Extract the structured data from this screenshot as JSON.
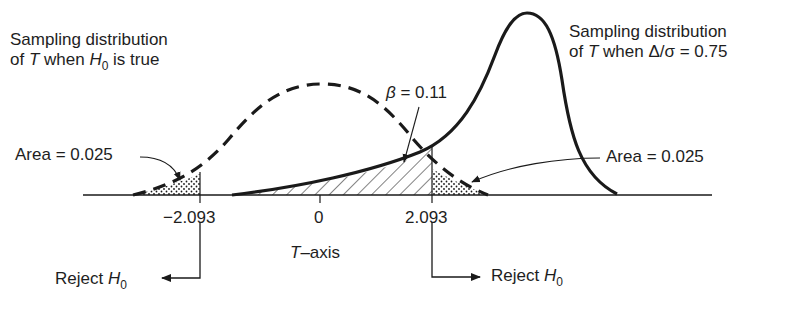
{
  "labels": {
    "null_dist_line1": "Sampling distribution",
    "null_dist_line2_pre": "of ",
    "null_dist_T": "T",
    "null_dist_line2_mid": " when ",
    "null_dist_H": "H",
    "null_dist_sub": "0",
    "null_dist_line2_post": " is true",
    "alt_dist_line1": "Sampling distribution",
    "alt_dist_line2_pre": "of ",
    "alt_dist_T": "T",
    "alt_dist_line2_post": " when Δ/σ = 0.75",
    "beta_symbol": "β",
    "beta_value": " = 0.11",
    "area_left": "Area = 0.025",
    "area_right": "Area = 0.025",
    "tick_left": "−2.093",
    "tick_zero": "0",
    "tick_right": "2.093",
    "axis_T": "T",
    "axis_suffix": "–axis",
    "reject_left": "Reject ",
    "reject_right": "Reject ",
    "reject_H": "H",
    "reject_sub": "0"
  },
  "colors": {
    "ink": "#1a1a1a",
    "background": "#ffffff"
  },
  "diagram": {
    "critical_values": [
      -2.093,
      2.093
    ],
    "alpha_each_tail": 0.025,
    "beta": 0.11,
    "effect_size_delta_over_sigma": 0.75,
    "null_curve_style": "dashed",
    "alt_curve_style": "solid"
  }
}
